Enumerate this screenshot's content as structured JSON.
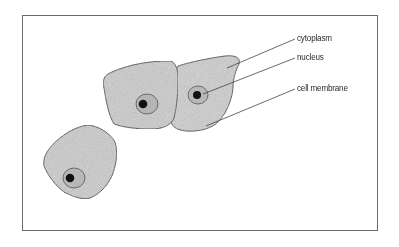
{
  "diagram": {
    "title": "",
    "type": "labeled-illustration",
    "labels": [
      {
        "id": "cytoplasm",
        "text": "cytoplasm"
      },
      {
        "id": "nucleus",
        "text": "nucleus"
      },
      {
        "id": "cell-membrane",
        "text": "cell membrane"
      }
    ],
    "colors": {
      "frame": "#6b6b6b",
      "cell_fill": "#c9c9c9",
      "cell_stroke": "#555555",
      "nucleus_fill": "#b3b3b3",
      "nucleolus": "#111111",
      "leader_line": "#444444"
    }
  }
}
